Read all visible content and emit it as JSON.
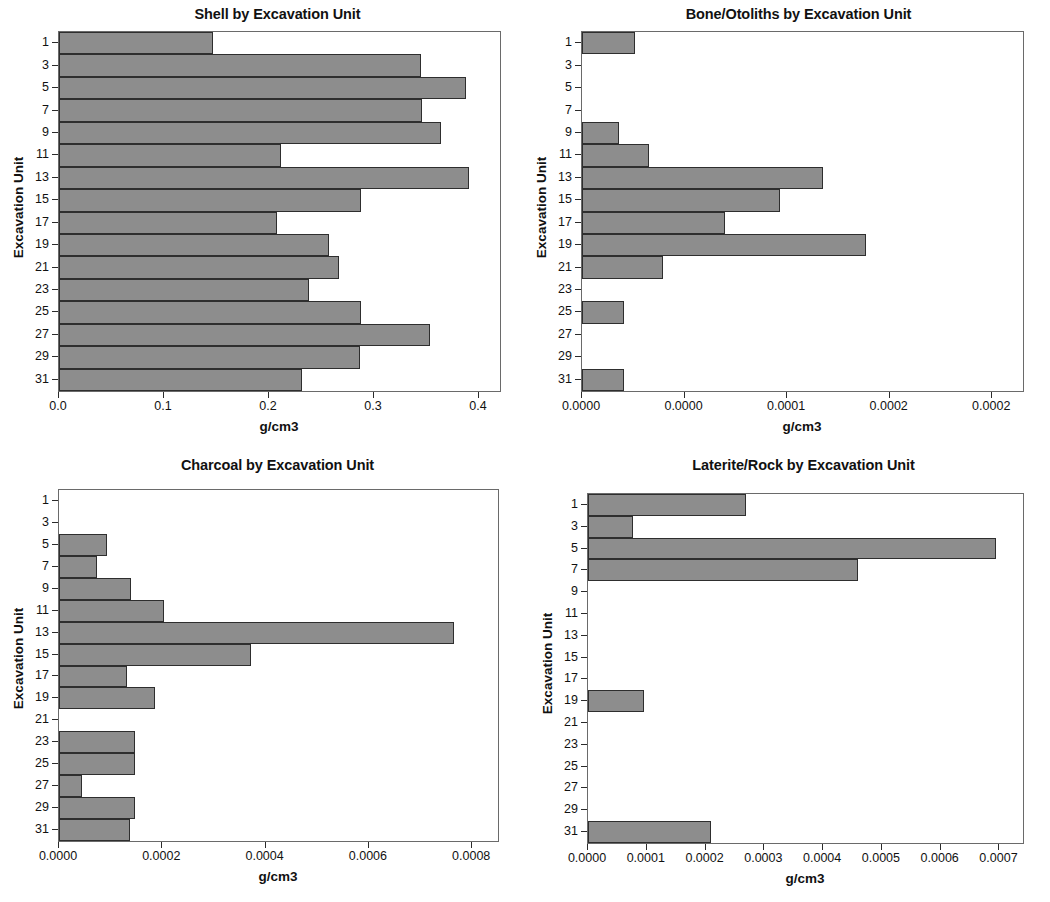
{
  "figure": {
    "axis_title": "g/cm3",
    "y_axis_title": "Excavation Unit",
    "bar_color": "#8d8d8d",
    "bar_border_color": "#2e2e2e",
    "axis_color": "#6a6a6a"
  },
  "chart_data": [
    {
      "id": "shell",
      "type": "bar",
      "orientation": "horizontal",
      "title": "Shell by Excavation Unit",
      "xlabel": "g/cm3",
      "ylabel": "Excavation Unit",
      "xlim": [
        0.0,
        0.42
      ],
      "xticks": [
        0.0,
        0.1,
        0.2,
        0.3,
        0.4
      ],
      "xticklabels": [
        "0.0",
        "0.1",
        "0.2",
        "0.3",
        "0.4"
      ],
      "categories": [
        "1",
        "3",
        "5",
        "7",
        "9",
        "11",
        "13",
        "15",
        "17",
        "19",
        "21",
        "23",
        "25",
        "27",
        "29",
        "31"
      ],
      "values": [
        0.147,
        0.345,
        0.388,
        0.346,
        0.364,
        0.211,
        0.39,
        0.288,
        0.208,
        0.257,
        0.267,
        0.238,
        0.288,
        0.353,
        0.287,
        0.231
      ],
      "grid": false,
      "legend": "none"
    },
    {
      "id": "bone_otoliths",
      "type": "bar",
      "orientation": "horizontal",
      "title": "Bone/Otoliths by Excavation Unit",
      "xlabel": "g/cm3",
      "ylabel": "Excavation Unit",
      "xlim": [
        0.0,
        0.000215
      ],
      "xticks": [
        0.0,
        5e-05,
        0.0001,
        0.00015,
        0.0002
      ],
      "xticklabels": [
        "0.0000",
        "0.0000",
        "0.0001",
        "0.0002",
        "0.0002"
      ],
      "categories": [
        "1",
        "3",
        "5",
        "7",
        "9",
        "11",
        "13",
        "15",
        "17",
        "19",
        "21",
        "23",
        "25",
        "27",
        "29",
        "31"
      ],
      "values": [
        2.6e-05,
        0.0,
        0.0,
        0.0,
        1.8e-05,
        3.25e-05,
        0.0001175,
        9.65e-05,
        6.95e-05,
        0.0001385,
        3.95e-05,
        0.0,
        2.05e-05,
        0.0,
        0.0,
        2.05e-05
      ],
      "grid": false,
      "legend": "none"
    },
    {
      "id": "charcoal",
      "type": "bar",
      "orientation": "horizontal",
      "title": "Charcoal by Excavation Unit",
      "xlabel": "g/cm3",
      "ylabel": "Excavation Unit",
      "xlim": [
        0.0,
        0.00085
      ],
      "xticks": [
        0.0,
        0.0002,
        0.0004,
        0.0006,
        0.0008
      ],
      "xticklabels": [
        "0.0000",
        "0.0002",
        "0.0004",
        "0.0006",
        "0.0008"
      ],
      "categories": [
        "1",
        "3",
        "5",
        "7",
        "9",
        "11",
        "13",
        "15",
        "17",
        "19",
        "21",
        "23",
        "25",
        "27",
        "29",
        "31"
      ],
      "values": [
        0.0,
        0.0,
        9.3e-05,
        7.3e-05,
        0.000139,
        0.000203,
        0.000765,
        0.000372,
        0.000132,
        0.000185,
        0.0,
        0.000147,
        0.000147,
        4.5e-05,
        0.000147,
        0.000137
      ],
      "grid": false,
      "legend": "none"
    },
    {
      "id": "laterite_rock",
      "type": "bar",
      "orientation": "horizontal",
      "title": "Laterite/Rock by Excavation Unit",
      "xlabel": "g/cm3",
      "ylabel": "Excavation Unit",
      "xlim": [
        0.0,
        0.00074
      ],
      "xticks": [
        0.0,
        0.0001,
        0.0002,
        0.0003,
        0.0004,
        0.0005,
        0.0006,
        0.0007
      ],
      "xticklabels": [
        "0.0000",
        "0.0001",
        "0.0002",
        "0.0003",
        "0.0004",
        "0.0005",
        "0.0006",
        "0.0007"
      ],
      "categories": [
        "1",
        "3",
        "5",
        "7",
        "9",
        "11",
        "13",
        "15",
        "17",
        "19",
        "21",
        "23",
        "25",
        "27",
        "29",
        "31"
      ],
      "values": [
        0.000268,
        7.65e-05,
        0.000694,
        0.000459,
        0.0,
        0.0,
        0.0,
        0.0,
        0.0,
        9.55e-05,
        0.0,
        0.0,
        0.0,
        0.0,
        0.0,
        0.000209
      ],
      "grid": false,
      "legend": "none"
    }
  ]
}
